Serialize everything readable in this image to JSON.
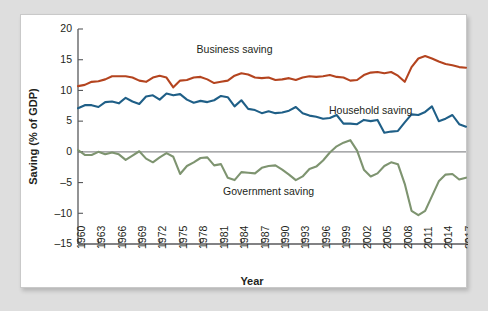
{
  "chart_data": {
    "type": "line",
    "title": "",
    "xlabel": "Year",
    "ylabel": "Saving (% of GDP)",
    "xlim": [
      1960,
      2017
    ],
    "ylim": [
      -15,
      20
    ],
    "grid": false,
    "legend_position": "inline-annotations",
    "y_ticks": [
      20,
      15,
      10,
      5,
      0,
      -5,
      -10,
      -15
    ],
    "y_tick_labels": [
      "20",
      "15",
      "10",
      "5",
      "0",
      "–5",
      "–10",
      "–15"
    ],
    "x_ticks": [
      1960,
      1963,
      1966,
      1969,
      1972,
      1975,
      1978,
      1981,
      1984,
      1987,
      1990,
      1993,
      1996,
      1999,
      2002,
      2005,
      2008,
      2011,
      2014,
      2017
    ],
    "x_tick_labels": [
      "1960",
      "1963",
      "1966",
      "1969",
      "1972",
      "1975",
      "1978",
      "1981",
      "1984",
      "1987",
      "1990",
      "1993",
      "1996",
      "1999",
      "2002",
      "2005",
      "2008",
      "2011",
      "2014",
      "2017"
    ],
    "x": [
      1960,
      1961,
      1962,
      1963,
      1964,
      1965,
      1966,
      1967,
      1968,
      1969,
      1970,
      1971,
      1972,
      1973,
      1974,
      1975,
      1976,
      1977,
      1978,
      1979,
      1980,
      1981,
      1982,
      1983,
      1984,
      1985,
      1986,
      1987,
      1988,
      1989,
      1990,
      1991,
      1992,
      1993,
      1994,
      1995,
      1996,
      1997,
      1998,
      1999,
      2000,
      2001,
      2002,
      2003,
      2004,
      2005,
      2006,
      2007,
      2008,
      2009,
      2010,
      2011,
      2012,
      2013,
      2014,
      2015,
      2016,
      2017
    ],
    "series": [
      {
        "name": "Business saving",
        "color": "#b4441f",
        "label": "Business saving",
        "label_x": 1983,
        "label_y": 16.6,
        "values": [
          10.7,
          10.9,
          11.4,
          11.5,
          11.8,
          12.3,
          12.3,
          12.3,
          12.1,
          11.6,
          11.4,
          12.1,
          12.4,
          12.1,
          10.5,
          11.6,
          11.7,
          12.1,
          12.2,
          11.8,
          11.2,
          11.4,
          11.6,
          12.4,
          12.8,
          12.6,
          12.1,
          12.0,
          12.1,
          11.7,
          11.8,
          12.0,
          11.7,
          12.1,
          12.3,
          12.2,
          12.3,
          12.5,
          12.2,
          12.1,
          11.6,
          11.7,
          12.5,
          12.9,
          13.0,
          12.8,
          13.0,
          12.4,
          11.4,
          13.8,
          15.2,
          15.6,
          15.2,
          14.7,
          14.3,
          14.1,
          13.8,
          13.7
        ]
      },
      {
        "name": "Household saving",
        "color": "#1f5f87",
        "label": "Household saving",
        "label_x": 2003,
        "label_y": 6.6,
        "values": [
          7.1,
          7.6,
          7.6,
          7.3,
          8.1,
          8.2,
          7.9,
          8.8,
          8.2,
          7.8,
          9.0,
          9.2,
          8.5,
          9.5,
          9.2,
          9.4,
          8.5,
          8.0,
          8.3,
          8.1,
          8.4,
          9.1,
          8.9,
          7.4,
          8.4,
          7.0,
          6.8,
          6.3,
          6.6,
          6.3,
          6.4,
          6.7,
          7.3,
          6.3,
          5.9,
          5.7,
          5.4,
          5.5,
          6.0,
          4.6,
          4.6,
          4.5,
          5.2,
          5.0,
          5.2,
          3.1,
          3.3,
          3.4,
          4.8,
          6.1,
          6.0,
          6.5,
          7.4,
          5.0,
          5.4,
          6.0,
          4.5,
          4.1
        ]
      },
      {
        "name": "Government saving",
        "color": "#7e9470",
        "label": "Government saving",
        "label_x": 1988,
        "label_y": -6.5,
        "values": [
          0.3,
          -0.5,
          -0.5,
          0.0,
          -0.4,
          -0.1,
          -0.4,
          -1.3,
          -0.6,
          0.1,
          -1.1,
          -1.7,
          -0.9,
          -0.2,
          -0.8,
          -3.6,
          -2.3,
          -1.7,
          -1.0,
          -0.9,
          -2.2,
          -2.0,
          -4.2,
          -4.6,
          -3.3,
          -3.4,
          -3.5,
          -2.6,
          -2.3,
          -2.2,
          -2.9,
          -3.7,
          -4.6,
          -4.0,
          -2.8,
          -2.4,
          -1.4,
          -0.1,
          0.9,
          1.5,
          1.9,
          0.2,
          -2.9,
          -4.0,
          -3.5,
          -2.3,
          -1.7,
          -2.0,
          -5.2,
          -9.6,
          -10.3,
          -9.6,
          -7.2,
          -4.8,
          -3.7,
          -3.6,
          -4.5,
          -4.2
        ]
      }
    ]
  }
}
